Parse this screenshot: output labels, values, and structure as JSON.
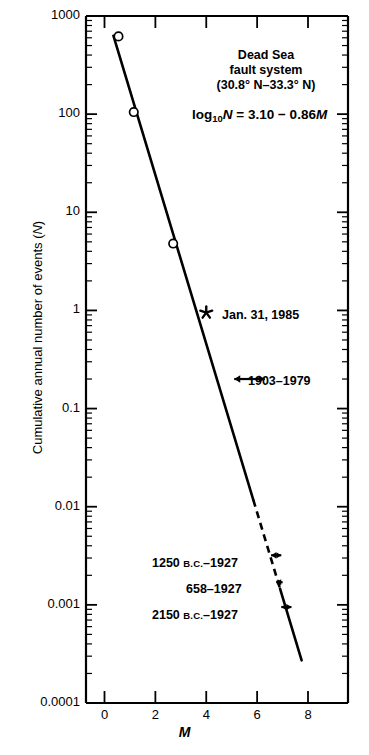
{
  "figure": {
    "title_lines": [
      "Dead Sea",
      "fault system",
      "(30.8° N–33.3° N)"
    ],
    "equation_plain": "log10N = 3.10 − 0.86M",
    "equation_parts": {
      "log": "log",
      "base": "10",
      "n": "N",
      "rest": " = 3.10 − 0.86",
      "m": "M"
    },
    "ylabel": "Cumulative annual number of events (",
    "ylabel_var": "N",
    "ylabel_tail": ")",
    "xlabel": "M"
  },
  "chart_data": {
    "type": "scatter",
    "title": "Dead Sea fault system (30.8° N–33.3° N)",
    "subtitle": "log10N = 3.10 − 0.86M",
    "xlabel": "M",
    "ylabel": "Cumulative annual number of events (N)",
    "xscale": "linear",
    "yscale": "log",
    "xlim": [
      -1.6,
      9.6
    ],
    "ylim": [
      0.0001,
      1000
    ],
    "grid": false,
    "legend": "none",
    "xticks": [
      0,
      2,
      4,
      6,
      8
    ],
    "xtick_labels": [
      "0",
      "2",
      "4",
      "6",
      "8"
    ],
    "yticks": [
      1000,
      100,
      10,
      1,
      0.1,
      0.01,
      0.001,
      0.0001
    ],
    "ytick_labels": [
      "1000",
      "100",
      "10",
      "1",
      "0.1",
      "0.01",
      "0.001",
      "0.0001"
    ],
    "series": [
      {
        "name": "Instrumental catalog (open circles)",
        "marker": "open-circle",
        "x": [
          0.55,
          1.15,
          2.7
        ],
        "y": [
          620,
          105,
          4.8
        ]
      },
      {
        "name": "Jan. 31, 1985 event",
        "marker": "asterisk",
        "x": [
          4.0
        ],
        "y": [
          0.95
        ]
      }
    ],
    "fit_line": {
      "name": "Gutenberg–Richter fit",
      "equation": "log10N = 3.10 - 0.86M",
      "intercept_a": 3.1,
      "slope_b": -0.86,
      "x_start": 0.35,
      "x_end": 5.85,
      "style": "solid"
    },
    "fit_line_extension": {
      "x_start": 5.85,
      "x_end": 6.9,
      "style": "dashed"
    },
    "fit_line_tail": {
      "x_start": 6.9,
      "x_end": 7.75,
      "style": "solid"
    },
    "range_annotations": [
      {
        "label": "1903–1979",
        "label_prefix": "1903–1979",
        "y": 0.2,
        "x_min": 5.1,
        "x_max": 6.3,
        "marker": "double-arrow"
      },
      {
        "label": "1250 B.C.–1927",
        "label_prefix": "1250 ",
        "label_smallcaps": "B.C.",
        "label_suffix": "–1927",
        "y": 0.0032,
        "x_min": 6.55,
        "x_max": 6.95,
        "marker": "double-arrow"
      },
      {
        "label": "658–1927",
        "label_prefix": "658–1927",
        "y": 0.0017,
        "x_min": 6.75,
        "x_max": 7.0,
        "marker": "double-arrow"
      },
      {
        "label": "2150 B.C.–1927",
        "label_prefix": "2150 ",
        "label_smallcaps": "B.C.",
        "label_suffix": "–1927",
        "y": 0.00095,
        "x_min": 6.95,
        "x_max": 7.35,
        "marker": "double-arrow"
      }
    ],
    "point_annotations": [
      {
        "label": "Jan. 31, 1985",
        "x": 4.0,
        "y": 0.95,
        "marker": "asterisk"
      }
    ]
  }
}
